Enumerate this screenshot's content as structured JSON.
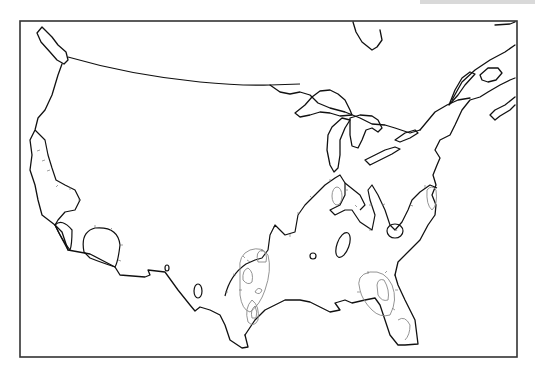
{
  "map": {
    "title": "",
    "region": "Contiguous United States and southern Canada",
    "frame": {
      "x": 20,
      "y": 21,
      "width": 497,
      "height": 336
    },
    "colors": {
      "background": "#ffffff",
      "coastline": "#111111",
      "frame": "#333333",
      "contour_inner": "#888888",
      "hachure_ticks": "#777777"
    },
    "features": [
      {
        "name": "coastline-and-borders",
        "type": "outline"
      },
      {
        "name": "great-lakes",
        "type": "outline"
      },
      {
        "name": "us-canada-border",
        "type": "line"
      },
      {
        "name": "contour-west-coast",
        "type": "hachured-contour"
      },
      {
        "name": "contour-baja-loop",
        "type": "hachured-contour"
      },
      {
        "name": "contour-south-central",
        "type": "hachured-contour"
      },
      {
        "name": "contour-texas-nested",
        "type": "nested-contours"
      },
      {
        "name": "contour-florida",
        "type": "nested-contours"
      },
      {
        "name": "contour-appalachian",
        "type": "hachured-contour"
      }
    ]
  }
}
